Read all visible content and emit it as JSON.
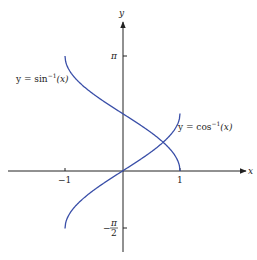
{
  "chart_data": {
    "type": "line",
    "title": "",
    "xlabel": "x",
    "ylabel": "y",
    "xlim": [
      -1.5,
      2.1
    ],
    "ylim": [
      -2.2,
      3.9
    ],
    "grid": false,
    "x_ticks": [
      {
        "value": -1,
        "label": "−1"
      },
      {
        "value": 1,
        "label": "1"
      }
    ],
    "y_ticks": [
      {
        "value": 3.14159,
        "label": "π"
      },
      {
        "value": -1.5708,
        "label": "−π/2"
      }
    ],
    "series": [
      {
        "name": "y = sin⁻¹(x)",
        "label_text": "y = sin",
        "label_sup": "−1",
        "label_arg": "(x)",
        "function": "arccos",
        "color": "#3a4fa8",
        "x": [
          -1,
          -0.9,
          -0.75,
          -0.5,
          -0.25,
          0,
          0.25,
          0.5,
          0.75,
          0.9,
          1
        ],
        "y": [
          3.1416,
          2.6906,
          2.4189,
          2.0944,
          1.8235,
          1.5708,
          1.3181,
          1.0472,
          0.7227,
          0.451,
          0
        ]
      },
      {
        "name": "y = cos⁻¹(x)",
        "label_text": "y = cos",
        "label_sup": "−1",
        "label_arg": "(x)",
        "function": "arcsin",
        "color": "#3a4fa8",
        "x": [
          -1,
          -0.9,
          -0.75,
          -0.5,
          -0.25,
          0,
          0.25,
          0.5,
          0.75,
          0.9,
          1
        ],
        "y": [
          -1.5708,
          -1.1198,
          -0.848,
          -0.5236,
          -0.2527,
          0,
          0.2527,
          0.5236,
          0.848,
          1.1198,
          1.5708
        ]
      }
    ],
    "legend": "inline labels next to curves"
  },
  "axes": {
    "x_name": "x",
    "y_name": "y",
    "x_tick_neg1": "−1",
    "x_tick_1": "1",
    "y_tick_pi": "π",
    "y_tick_neg_pi_num": "π",
    "y_tick_neg_pi_den": "2",
    "y_tick_neg_sign": "−"
  },
  "labels": {
    "curve1_main": "y = sin",
    "curve1_sup": "−1",
    "curve1_arg": "(x)",
    "curve2_main": "y = cos",
    "curve2_sup": "−1",
    "curve2_arg": "(x)"
  }
}
